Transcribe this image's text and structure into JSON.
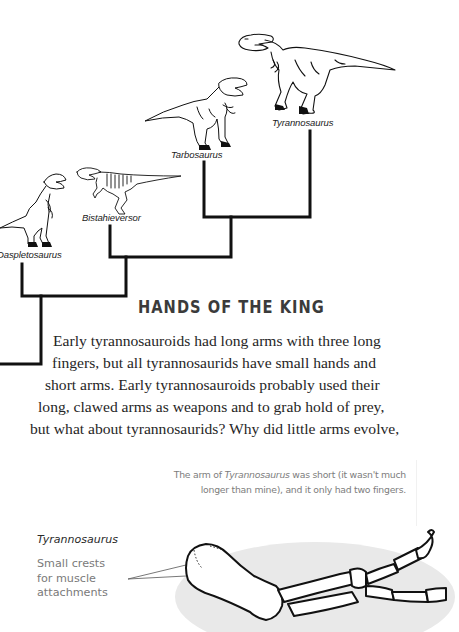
{
  "cladogram": {
    "taxa": [
      {
        "name": "Tyrannosaurus"
      },
      {
        "name": "Tarbosaurus"
      },
      {
        "name": "Bistahieversor"
      },
      {
        "name": "Daspletosaurus"
      }
    ],
    "line_color": "#111111"
  },
  "section": {
    "heading": "HANDS OF THE KING",
    "heading_color": "#3b3b3b",
    "paragraph_lines": [
      "Early tyrannosauroids had long arms with three long",
      "fingers, but all tyrannosaurids have small hands and",
      "short arms. Early tyrannosauroids probably used their",
      "long, clawed arms as weapons and to grab hold of prey,",
      "but what about tyrannosaurids? Why did little arms evolve,"
    ]
  },
  "caption": {
    "line1_prefix": "The arm of ",
    "line1_italic": "Tyrannosaurus",
    "line1_suffix": " was short (it wasn't much",
    "line2": "longer than mine), and it only had two fingers."
  },
  "arm_figure": {
    "species": "Tyrannosaurus",
    "annotation_lines": [
      "Small crests",
      "for muscle",
      "attachments"
    ],
    "background_color": "#e8e8e8"
  }
}
